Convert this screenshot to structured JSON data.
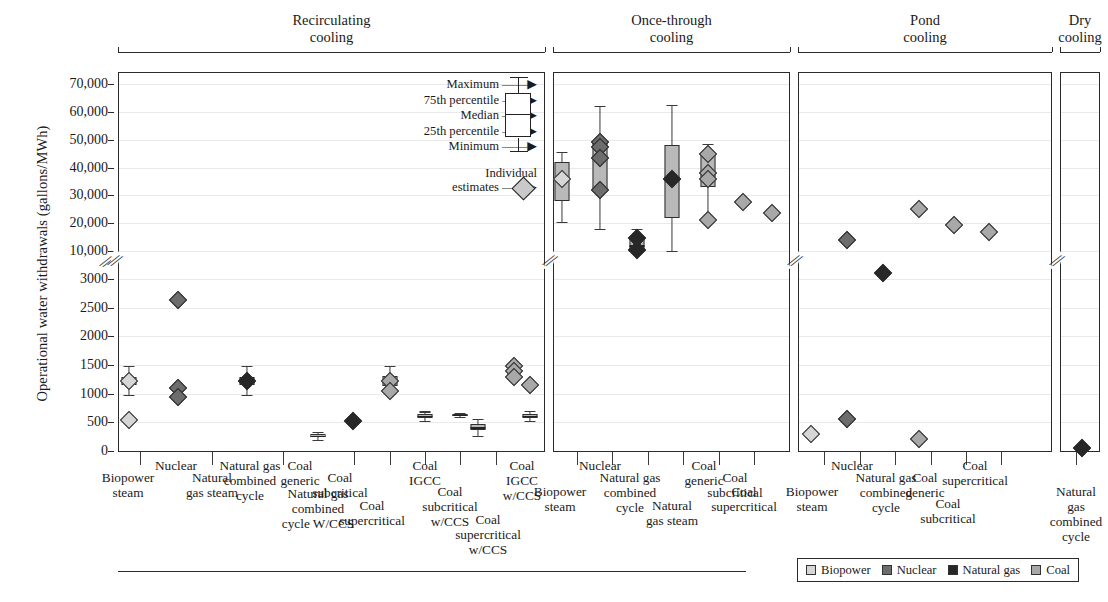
{
  "axis": {
    "y_title": "Operational water withdrawals (gallons/MWh)",
    "y_ticks_upper": [
      "70,000",
      "60,000",
      "50,000",
      "40,000",
      "30,000",
      "20,000",
      "10,000"
    ],
    "y_ticks_lower": [
      "3000",
      "2500",
      "2000",
      "1500",
      "1000",
      "500",
      "0"
    ],
    "break_symbol": "∕∕"
  },
  "groups": [
    {
      "id": "recirculating",
      "title_line1": "Recirculating",
      "title_line2": "cooling"
    },
    {
      "id": "once-through",
      "title_line1": "Once-through",
      "title_line2": "cooling"
    },
    {
      "id": "pond",
      "title_line1": "Pond",
      "title_line2": "cooling"
    },
    {
      "id": "dry",
      "title_line1": "Dry",
      "title_line2": "cooling"
    }
  ],
  "box_key": {
    "rows": [
      "Maximum",
      "75th percentile",
      "Median",
      "25th percentile",
      "Minimum"
    ],
    "individual_line1": "Individual",
    "individual_line2": "estimates"
  },
  "series_legend": [
    {
      "name": "Biopower",
      "color": "#d6d6d6"
    },
    {
      "name": "Nuclear",
      "color": "#6d6d6d"
    },
    {
      "name": "Natural gas",
      "color": "#272727"
    },
    {
      "name": "Coal",
      "color": "#a8a8a8"
    }
  ],
  "categories": {
    "recirculating": [
      "Biopower steam",
      "Nuclear",
      "Natural gas steam",
      "Natural gas combined cycle",
      "Natural gas combined cycle W/CCS",
      "Coal generic",
      "Coal subcritical",
      "Coal supercritical",
      "Coal IGCC",
      "Coal subcritical w/CCS",
      "Coal supercritical w/CCS",
      "Coal IGCC w/CCS"
    ],
    "once_through": [
      "Biopower steam",
      "Nuclear",
      "Natural gas combined cycle",
      "Natural gas steam",
      "Coal generic",
      "Coal subcritical",
      "Coal supercritical"
    ],
    "pond": [
      "Biopower steam",
      "Nuclear",
      "Natural gas combined cycle",
      "Coal generic",
      "Coal subcritical",
      "Coal supercritical"
    ],
    "dry": [
      "Natural gas combined cycle"
    ]
  },
  "chart_data": {
    "type": "scatter",
    "title": "",
    "xlabel": "",
    "ylabel": "Operational water withdrawals (gallons/MWh)",
    "y_axis_note": "Broken axis: lower segment 0-3000 linear, upper segment 10,000-70,000 linear",
    "ylim_lower": [
      0,
      3000
    ],
    "ylim_upper": [
      10000,
      70000
    ],
    "grid": true,
    "legend_position": "bottom-right",
    "groups": [
      {
        "group": "Recirculating cooling",
        "columns": [
          {
            "category": "Biopower steam",
            "series": "Biopower",
            "points": [
              1220,
              540
            ],
            "box": {
              "min": 980,
              "q1": 1150,
              "median": 1220,
              "q3": 1290,
              "max": 1480
            }
          },
          {
            "category": "Nuclear",
            "series": "Nuclear",
            "points": [
              2630,
              1100,
              950
            ]
          },
          {
            "category": "Natural gas steam",
            "series": "Natural gas",
            "points": [
              1220
            ],
            "box": {
              "min": 980,
              "q1": 1150,
              "median": 1220,
              "q3": 1290,
              "max": 1490
            }
          },
          {
            "category": "Natural gas combined cycle",
            "series": "Natural gas",
            "points": [],
            "box": {
              "min": 200,
              "q1": 240,
              "median": 265,
              "q3": 300,
              "max": 340
            }
          },
          {
            "category": "Natural gas combined cycle W/CCS",
            "series": "Natural gas",
            "points": [
              520
            ],
            "box": {
              "min": 480,
              "q1": 505,
              "median": 520,
              "q3": 540,
              "max": 570
            }
          },
          {
            "category": "Coal generic",
            "series": "Coal",
            "points": [
              1220,
              1040
            ],
            "box": {
              "min": 1000,
              "q1": 1130,
              "median": 1220,
              "q3": 1300,
              "max": 1480
            }
          },
          {
            "category": "Coal subcritical",
            "series": "Coal",
            "points": [],
            "box": {
              "min": 520,
              "q1": 570,
              "median": 610,
              "q3": 650,
              "max": 690
            }
          },
          {
            "category": "Coal supercritical",
            "series": "Coal",
            "points": [],
            "box": {
              "min": 590,
              "q1": 610,
              "median": 625,
              "q3": 640,
              "max": 660
            }
          },
          {
            "category": "Coal IGCC",
            "series": "Coal",
            "points": [],
            "box": {
              "min": 270,
              "q1": 360,
              "median": 410,
              "q3": 470,
              "max": 560
            }
          },
          {
            "category": "Coal subcritical w/CCS",
            "series": "Coal",
            "points": [
              1480,
              1390,
              1290
            ]
          },
          {
            "category": "Coal supercritical w/CCS",
            "series": "Coal",
            "points": [
              1150
            ]
          },
          {
            "category": "Coal IGCC w/CCS",
            "series": "Coal",
            "points": [],
            "box": {
              "min": 520,
              "q1": 570,
              "median": 610,
              "q3": 650,
              "max": 700
            }
          }
        ]
      },
      {
        "group": "Once-through cooling",
        "columns": [
          {
            "category": "Biopower steam",
            "series": "Biopower",
            "points": [
              36000
            ],
            "box": {
              "min": 20500,
              "q1": 28000,
              "median": 36000,
              "q3": 42000,
              "max": 45500
            }
          },
          {
            "category": "Nuclear",
            "series": "Nuclear",
            "points": [
              49000,
              47500,
              43500,
              32000
            ],
            "box": {
              "min": 18000,
              "q1": 32000,
              "median": 43500,
              "q3": 49000,
              "max": 62000
            }
          },
          {
            "category": "Natural gas combined cycle",
            "series": "Natural gas",
            "points": [
              14500,
              10500
            ],
            "box": {
              "min": 9800,
              "q1": 10500,
              "median": 12000,
              "q3": 14500,
              "max": 18000
            }
          },
          {
            "category": "Natural gas steam",
            "series": "Natural gas",
            "points": [
              36000
            ],
            "box": {
              "min": 10000,
              "q1": 22000,
              "median": 36000,
              "q3": 48000,
              "max": 62500
            }
          },
          {
            "category": "Coal generic",
            "series": "Coal",
            "points": [
              45000,
              38000,
              36000,
              21000
            ],
            "box": {
              "min": 21000,
              "q1": 33000,
              "median": 38000,
              "q3": 45000,
              "max": 48500
            }
          },
          {
            "category": "Coal subcritical",
            "series": "Coal",
            "points": [
              27500
            ]
          },
          {
            "category": "Coal supercritical",
            "series": "Coal",
            "points": [
              23500
            ]
          }
        ]
      },
      {
        "group": "Pond cooling",
        "columns": [
          {
            "category": "Biopower steam",
            "series": "Biopower",
            "points": [
              290
            ]
          },
          {
            "category": "Nuclear",
            "series": "Nuclear",
            "points": [
              14000,
              560
            ]
          },
          {
            "category": "Natural gas combined cycle",
            "series": "Natural gas",
            "points": [
              3100
            ]
          },
          {
            "category": "Coal generic",
            "series": "Coal",
            "points": [
              25000,
              210
            ]
          },
          {
            "category": "Coal subcritical",
            "series": "Coal",
            "points": [
              19500
            ]
          },
          {
            "category": "Coal supercritical",
            "series": "Coal",
            "points": [
              17000
            ]
          }
        ]
      },
      {
        "group": "Dry cooling",
        "columns": [
          {
            "category": "Natural gas combined cycle",
            "series": "Natural gas",
            "points": [
              60
            ]
          }
        ]
      }
    ]
  }
}
